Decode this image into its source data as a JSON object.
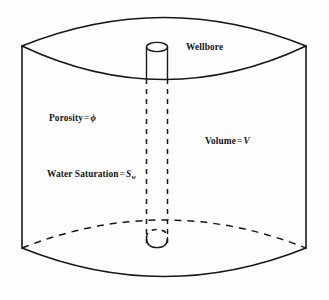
{
  "figure": {
    "name": "reservoir-volume-cylinder-diagram",
    "background_color": "#fefefe",
    "line_color": "#171717"
  },
  "labels": {
    "wellbore": "Wellbore",
    "porosity_text": "Porosity",
    "porosity_equals": "=",
    "porosity_symbol": "ϕ",
    "volume_text": "Volume",
    "volume_equals": "=",
    "volume_symbol": "V",
    "water_saturation_text": "Water Saturation",
    "water_saturation_equals": "=",
    "water_saturation_symbol": "S",
    "water_saturation_subscript": "w"
  },
  "geometry": {
    "cylinder": {
      "left_x": 22,
      "right_x": 306,
      "top_corner_y": 46,
      "bottom_corner_y": 248,
      "top_back_apex_y": 13,
      "top_front_dip_y": 85,
      "bottom_front_dip_y": 277
    },
    "wellbore": {
      "left_x": 147,
      "right_x": 167,
      "top_ellipse_y": 47,
      "bottom_ellipse_y": 242,
      "ellipse_ry": 5
    }
  }
}
